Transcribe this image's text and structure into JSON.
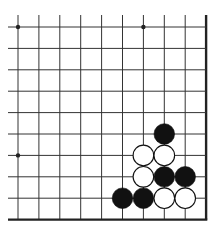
{
  "game": "go",
  "board_view": {
    "visible_cols": 10,
    "visible_rows": 10,
    "origin_px": [
      18,
      27
    ],
    "spacing_px": [
      20.9,
      21.4
    ],
    "extend_left_px": 10,
    "extend_top_px": 12,
    "right_edge": true,
    "bottom_edge": true
  },
  "colors": {
    "background": "#ffffff",
    "line": "#333333",
    "edge": "#222222",
    "black_stone": "#111111",
    "white_stone": "#ffffff",
    "stone_outline": "#111111"
  },
  "star_points": [
    [
      0,
      0
    ],
    [
      6,
      0
    ],
    [
      0,
      6
    ]
  ],
  "stones": [
    {
      "color": "black",
      "col": 7,
      "row": 5
    },
    {
      "color": "white",
      "col": 6,
      "row": 6
    },
    {
      "color": "white",
      "col": 7,
      "row": 6
    },
    {
      "color": "white",
      "col": 6,
      "row": 7
    },
    {
      "color": "black",
      "col": 7,
      "row": 7
    },
    {
      "color": "black",
      "col": 8,
      "row": 7
    },
    {
      "color": "black",
      "col": 5,
      "row": 8
    },
    {
      "color": "black",
      "col": 6,
      "row": 8
    },
    {
      "color": "white",
      "col": 7,
      "row": 8
    },
    {
      "color": "white",
      "col": 8,
      "row": 8
    }
  ]
}
